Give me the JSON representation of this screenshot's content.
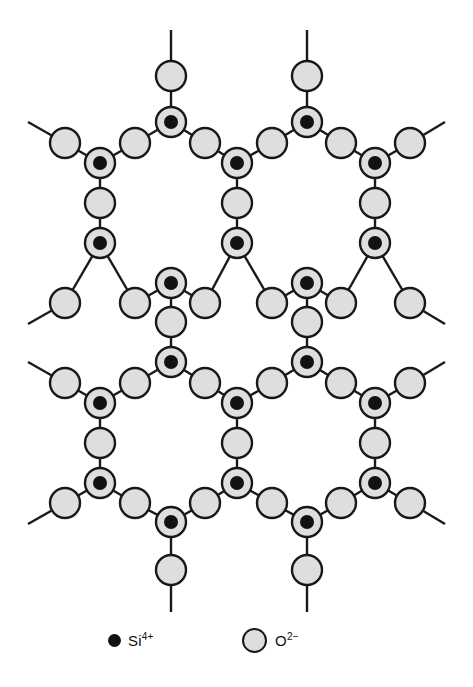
{
  "figure": {
    "background_color": "#ffffff",
    "bond_color": "#1a1a1a",
    "oxygen_fill_color": "#dedede",
    "oxygen_stroke_color": "#181818",
    "silicon_dot_color": "#121212",
    "width": 473,
    "height": 687
  },
  "legend": {
    "items": [
      {
        "id": "silicon",
        "symbol": "Si",
        "charge": "4+",
        "label": "Si4+",
        "marker": "small-filled-black-dot",
        "marker_color": "#121212"
      },
      {
        "id": "oxygen",
        "symbol": "O",
        "charge": "2-",
        "label": "O2-",
        "marker": "large-gray-filled-circle",
        "marker_color": "#dedede"
      }
    ]
  },
  "lattice": {
    "type": "honeycomb-network",
    "silicon_radius_ring": 15,
    "silicon_radius_dot": 7,
    "oxygen_radius": 15,
    "silicon_sites": [
      {
        "x": 171,
        "y": 122,
        "orientation": "up"
      },
      {
        "x": 307,
        "y": 122,
        "orientation": "up"
      },
      {
        "x": 100,
        "y": 163,
        "orientation": "down"
      },
      {
        "x": 237,
        "y": 163,
        "orientation": "down"
      },
      {
        "x": 375,
        "y": 163,
        "orientation": "down"
      },
      {
        "x": 100,
        "y": 243,
        "orientation": "up"
      },
      {
        "x": 237,
        "y": 243,
        "orientation": "up"
      },
      {
        "x": 375,
        "y": 243,
        "orientation": "up"
      },
      {
        "x": 171,
        "y": 283,
        "orientation": "down"
      },
      {
        "x": 307,
        "y": 283,
        "orientation": "down"
      },
      {
        "x": 171,
        "y": 362,
        "orientation": "up"
      },
      {
        "x": 307,
        "y": 362,
        "orientation": "up"
      },
      {
        "x": 100,
        "y": 403,
        "orientation": "down"
      },
      {
        "x": 237,
        "y": 403,
        "orientation": "down"
      },
      {
        "x": 375,
        "y": 403,
        "orientation": "down"
      },
      {
        "x": 100,
        "y": 483,
        "orientation": "up"
      },
      {
        "x": 237,
        "y": 483,
        "orientation": "up"
      },
      {
        "x": 375,
        "y": 483,
        "orientation": "up"
      },
      {
        "x": 171,
        "y": 522,
        "orientation": "down"
      },
      {
        "x": 307,
        "y": 522,
        "orientation": "down"
      }
    ],
    "oxygen_sites": [
      {
        "x": 171,
        "y": 76
      },
      {
        "x": 307,
        "y": 76
      },
      {
        "x": 65,
        "y": 143
      },
      {
        "x": 135,
        "y": 143
      },
      {
        "x": 205,
        "y": 143
      },
      {
        "x": 272,
        "y": 143
      },
      {
        "x": 341,
        "y": 143
      },
      {
        "x": 410,
        "y": 143
      },
      {
        "x": 100,
        "y": 203
      },
      {
        "x": 237,
        "y": 203
      },
      {
        "x": 375,
        "y": 203
      },
      {
        "x": 65,
        "y": 303
      },
      {
        "x": 135,
        "y": 303
      },
      {
        "x": 205,
        "y": 303
      },
      {
        "x": 272,
        "y": 303
      },
      {
        "x": 341,
        "y": 303
      },
      {
        "x": 410,
        "y": 303
      },
      {
        "x": 171,
        "y": 322
      },
      {
        "x": 307,
        "y": 322
      },
      {
        "x": 65,
        "y": 383
      },
      {
        "x": 135,
        "y": 383
      },
      {
        "x": 205,
        "y": 383
      },
      {
        "x": 272,
        "y": 383
      },
      {
        "x": 341,
        "y": 383
      },
      {
        "x": 410,
        "y": 383
      },
      {
        "x": 100,
        "y": 443
      },
      {
        "x": 237,
        "y": 443
      },
      {
        "x": 375,
        "y": 443
      },
      {
        "x": 65,
        "y": 503
      },
      {
        "x": 135,
        "y": 503
      },
      {
        "x": 205,
        "y": 503
      },
      {
        "x": 272,
        "y": 503
      },
      {
        "x": 341,
        "y": 503
      },
      {
        "x": 410,
        "y": 503
      },
      {
        "x": 171,
        "y": 570
      },
      {
        "x": 307,
        "y": 570
      }
    ],
    "bonds": [
      [
        171,
        76,
        171,
        122
      ],
      [
        307,
        76,
        307,
        122
      ],
      [
        171,
        30,
        171,
        76
      ],
      [
        307,
        30,
        307,
        76
      ],
      [
        171,
        122,
        135,
        143
      ],
      [
        171,
        122,
        205,
        143
      ],
      [
        307,
        122,
        272,
        143
      ],
      [
        307,
        122,
        341,
        143
      ],
      [
        65,
        143,
        100,
        163
      ],
      [
        135,
        143,
        100,
        163
      ],
      [
        205,
        143,
        237,
        163
      ],
      [
        272,
        143,
        237,
        163
      ],
      [
        341,
        143,
        375,
        163
      ],
      [
        410,
        143,
        375,
        163
      ],
      [
        28,
        122,
        65,
        143
      ],
      [
        445,
        122,
        410,
        143
      ],
      [
        100,
        163,
        100,
        203
      ],
      [
        237,
        163,
        237,
        203
      ],
      [
        375,
        163,
        375,
        203
      ],
      [
        100,
        203,
        100,
        243
      ],
      [
        237,
        203,
        237,
        243
      ],
      [
        375,
        203,
        375,
        243
      ],
      [
        100,
        243,
        65,
        303
      ],
      [
        100,
        243,
        135,
        303
      ],
      [
        237,
        243,
        205,
        303
      ],
      [
        237,
        243,
        272,
        303
      ],
      [
        375,
        243,
        341,
        303
      ],
      [
        375,
        243,
        410,
        303
      ],
      [
        28,
        324,
        65,
        303
      ],
      [
        445,
        324,
        410,
        303
      ],
      [
        135,
        303,
        171,
        283
      ],
      [
        205,
        303,
        171,
        283
      ],
      [
        272,
        303,
        307,
        283
      ],
      [
        341,
        303,
        307,
        283
      ],
      [
        171,
        283,
        171,
        322
      ],
      [
        307,
        283,
        307,
        322
      ],
      [
        171,
        322,
        171,
        362
      ],
      [
        307,
        322,
        307,
        362
      ],
      [
        171,
        362,
        135,
        383
      ],
      [
        171,
        362,
        205,
        383
      ],
      [
        307,
        362,
        272,
        383
      ],
      [
        307,
        362,
        341,
        383
      ],
      [
        65,
        383,
        100,
        403
      ],
      [
        135,
        383,
        100,
        403
      ],
      [
        205,
        383,
        237,
        403
      ],
      [
        272,
        383,
        237,
        403
      ],
      [
        341,
        383,
        375,
        403
      ],
      [
        410,
        383,
        375,
        403
      ],
      [
        28,
        362,
        65,
        383
      ],
      [
        445,
        362,
        410,
        383
      ],
      [
        100,
        403,
        100,
        443
      ],
      [
        237,
        403,
        237,
        443
      ],
      [
        375,
        403,
        375,
        443
      ],
      [
        100,
        443,
        100,
        483
      ],
      [
        237,
        443,
        237,
        483
      ],
      [
        375,
        443,
        375,
        483
      ],
      [
        100,
        483,
        65,
        503
      ],
      [
        100,
        483,
        135,
        503
      ],
      [
        237,
        483,
        205,
        503
      ],
      [
        237,
        483,
        272,
        503
      ],
      [
        375,
        483,
        341,
        503
      ],
      [
        375,
        483,
        410,
        503
      ],
      [
        28,
        524,
        65,
        503
      ],
      [
        445,
        524,
        410,
        503
      ],
      [
        135,
        503,
        171,
        522
      ],
      [
        205,
        503,
        171,
        522
      ],
      [
        272,
        503,
        307,
        522
      ],
      [
        341,
        503,
        307,
        522
      ],
      [
        171,
        522,
        171,
        570
      ],
      [
        307,
        522,
        307,
        570
      ],
      [
        171,
        570,
        171,
        612
      ],
      [
        307,
        570,
        307,
        612
      ]
    ]
  }
}
